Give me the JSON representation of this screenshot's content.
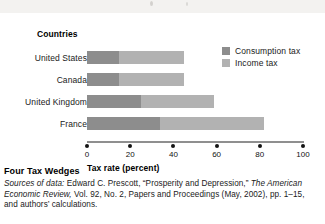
{
  "figure": {
    "caption_title": "Four Tax Wedges",
    "source_prefix": "Sources of data:",
    "source_rest_1": " Edward C. Prescott, “Prosperity and Depression,” ",
    "source_italic_2": "The American Economic Review,",
    "source_rest_2": " Vol. 92, No. 2, Papers and Proceedings (May, 2002), pp. 1–15, and authors’ calculations."
  },
  "chart_data": {
    "type": "bar",
    "orientation": "horizontal",
    "stacked": true,
    "title": "",
    "category_axis_title": "Countries",
    "xlabel": "Tax rate (percent)",
    "ylabel": "",
    "xlim": [
      0,
      100
    ],
    "xticks": [
      0,
      20,
      40,
      60,
      80,
      100
    ],
    "xtick_labels": [
      "0",
      "20",
      "40",
      "60",
      "80",
      "100"
    ],
    "grid": false,
    "legend_position": "top-right",
    "categories": [
      "United States",
      "Canada",
      "United Kingdom",
      "France"
    ],
    "series": [
      {
        "name": "Consumption tax",
        "color": "#8d8d8d",
        "values": [
          15,
          15,
          25,
          34
        ]
      },
      {
        "name": "Income tax",
        "color": "#b2b2b2",
        "values": [
          30,
          30,
          34,
          48
        ]
      }
    ],
    "totals": [
      45,
      45,
      59,
      82
    ]
  }
}
